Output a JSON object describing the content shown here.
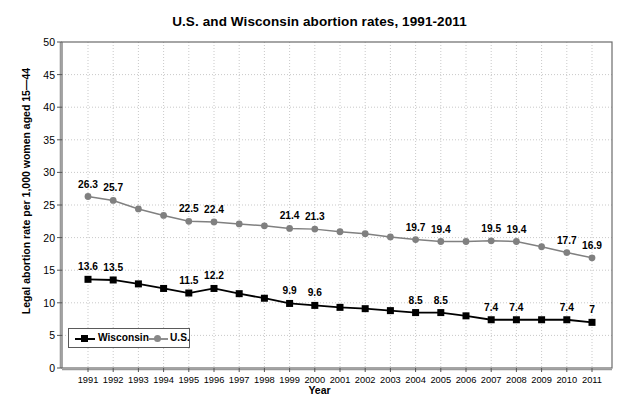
{
  "chart_data": {
    "type": "line",
    "title": "U.S. and Wisconsin abortion rates, 1991-2011",
    "xlabel": "Year",
    "ylabel": "Legal abortion rate per 1,000 women aged 15—44",
    "ylim": [
      0,
      50
    ],
    "ytick_step": 5,
    "yticks": [
      "0",
      "5",
      "10",
      "15",
      "20",
      "25",
      "30",
      "35",
      "40",
      "45",
      "50"
    ],
    "grid": true,
    "legend_position": "inside-bottom-left",
    "categories": [
      "1991",
      "1992",
      "1993",
      "1994",
      "1995",
      "1996",
      "1997",
      "1998",
      "1999",
      "2000",
      "2001",
      "2002",
      "2003",
      "2004",
      "2005",
      "2006",
      "2007",
      "2008",
      "2009",
      "2010",
      "2011"
    ],
    "series": [
      {
        "name": "Wisconsin",
        "color": "#000000",
        "marker": "square",
        "values": [
          13.6,
          13.5,
          12.9,
          12.2,
          11.5,
          12.2,
          11.4,
          10.7,
          9.9,
          9.6,
          9.3,
          9.1,
          8.8,
          8.5,
          8.5,
          8.0,
          7.4,
          7.4,
          7.4,
          7.4,
          7.0
        ],
        "labels": {
          "1991": "13.6",
          "1992": "13.5",
          "1995": "11.5",
          "1996": "12.2",
          "1999": "9.9",
          "2000": "9.6",
          "2004": "8.5",
          "2005": "8.5",
          "2007": "7.4",
          "2008": "7.4",
          "2010": "7.4",
          "2011": "7"
        }
      },
      {
        "name": "U.S.",
        "color": "#808080",
        "marker": "circle",
        "values": [
          26.3,
          25.7,
          24.4,
          23.4,
          22.5,
          22.4,
          22.1,
          21.8,
          21.4,
          21.3,
          20.9,
          20.6,
          20.1,
          19.7,
          19.4,
          19.4,
          19.5,
          19.4,
          18.6,
          17.7,
          16.9
        ],
        "labels": {
          "1991": "26.3",
          "1992": "25.7",
          "1995": "22.5",
          "1996": "22.4",
          "1999": "21.4",
          "2000": "21.3",
          "2004": "19.7",
          "2005": "19.4",
          "2007": "19.5",
          "2008": "19.4",
          "2010": "17.7",
          "2011": "16.9"
        }
      }
    ],
    "legend": [
      {
        "label": "Wisconsin",
        "marker": "square",
        "color": "#000000"
      },
      {
        "label": "U.S.",
        "marker": "circle",
        "color": "#808080"
      }
    ]
  }
}
